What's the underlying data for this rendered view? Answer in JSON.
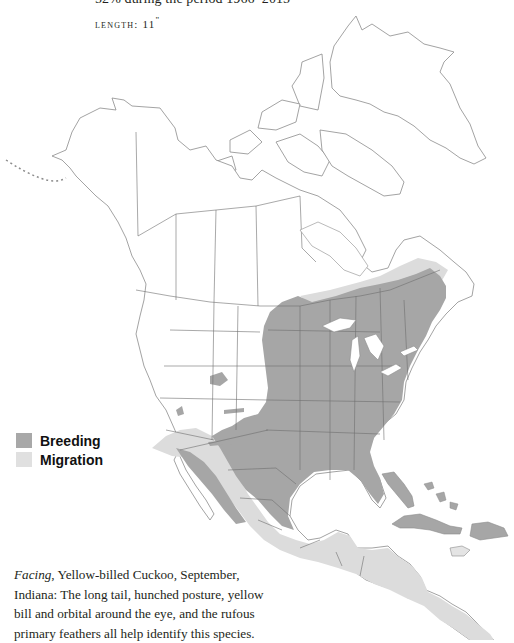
{
  "header": {
    "population_trend_text": "−52% during the period 1966–2015",
    "length_label": "LENGTH:",
    "length_value": "11",
    "length_unit": "\""
  },
  "map": {
    "title": "Yellow-billed Cuckoo range map",
    "colors": {
      "breeding": "#a6a6a6",
      "migration": "#dcdcdc",
      "land": "#ffffff",
      "outline": "#8c8c8c"
    }
  },
  "legend": {
    "items": [
      {
        "label": "Breeding",
        "color": "#a8a8a8"
      },
      {
        "label": "Migration",
        "color": "#e0e0e0"
      }
    ]
  },
  "caption": {
    "lead_italic": "Facing",
    "text": ", Yellow-billed Cuckoo, September, Indiana: The long tail, hunched posture, yellow bill and orbital around the eye, and the rufous primary feathers all help identify this species."
  }
}
